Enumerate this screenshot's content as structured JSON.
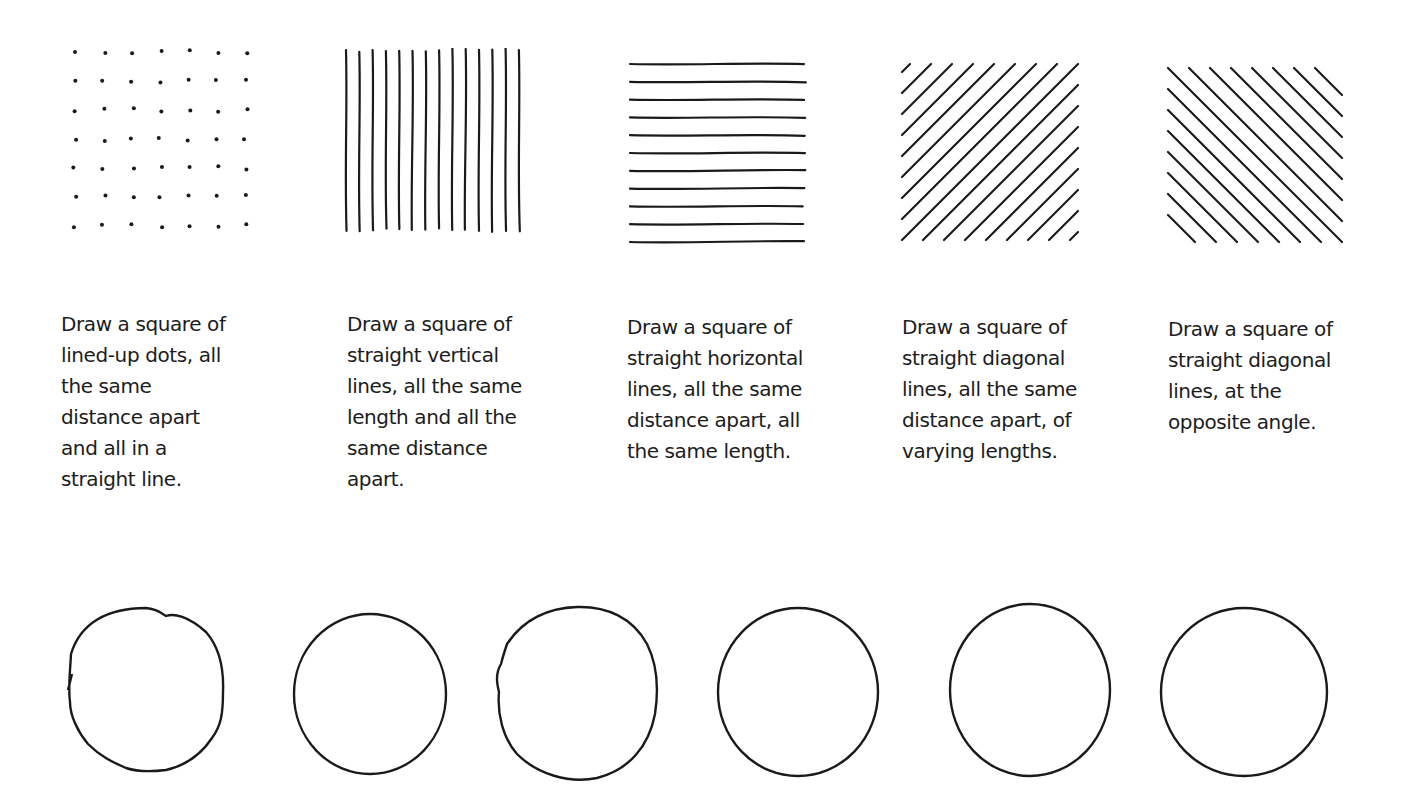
{
  "exercises": [
    {
      "pattern": "dots",
      "caption": "Draw a square of\nlined-up dots, all\nthe same\ndistance apart\nand all in a\nstraight line."
    },
    {
      "pattern": "vertical-lines",
      "caption": "Draw a square of\nstraight vertical\nlines, all the same\nlength and all the\nsame distance\napart."
    },
    {
      "pattern": "horizontal-lines",
      "caption": "Draw a square of\nstraight horizontal\nlines, all the same\ndistance apart, all\nthe same length."
    },
    {
      "pattern": "diagonal-lines-up",
      "caption": "Draw a square of\nstraight diagonal\nlines, all the same\ndistance apart, of\nvarying lengths."
    },
    {
      "pattern": "diagonal-lines-down",
      "caption": "Draw a square of\nstraight diagonal\nlines, at the\nopposite angle."
    }
  ],
  "circles": [
    {
      "label": "circle-1"
    },
    {
      "label": "circle-2"
    },
    {
      "label": "circle-3"
    },
    {
      "label": "circle-4"
    },
    {
      "label": "circle-5"
    },
    {
      "label": "circle-6"
    }
  ],
  "colors": {
    "ink": "#1a1a1a",
    "paper": "#ffffff"
  }
}
